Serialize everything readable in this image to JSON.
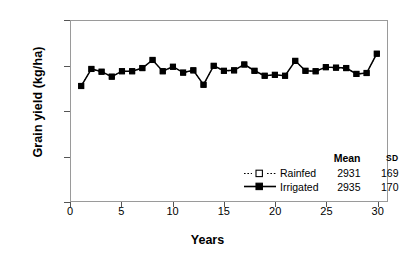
{
  "chart_data": {
    "type": "line",
    "title": "",
    "xlabel": "Years",
    "ylabel": "Grain yield (kg/ha)",
    "xlim": [
      0,
      31
    ],
    "ylim": [
      0,
      4000
    ],
    "grid": false,
    "legend_position": "inside-bottom-right",
    "x_ticks": [
      "0",
      "5",
      "10",
      "15",
      "20",
      "25",
      "30"
    ],
    "x_tick_values": [
      0,
      5,
      10,
      15,
      20,
      25,
      30
    ],
    "y_ticks": [
      "0",
      "1000",
      "2000",
      "3000",
      "4000"
    ],
    "y_tick_values": [
      0,
      1000,
      2000,
      3000,
      4000
    ],
    "x": [
      1,
      2,
      3,
      4,
      5,
      6,
      7,
      8,
      9,
      10,
      11,
      12,
      13,
      14,
      15,
      16,
      17,
      18,
      19,
      20,
      21,
      22,
      23,
      24,
      25,
      26,
      27,
      28,
      29,
      30
    ],
    "series": [
      {
        "name": "Rainfed",
        "marker": "open-square",
        "line": "dotted",
        "mean": 2931,
        "sd": 169,
        "values": [
          2560,
          2930,
          2870,
          2760,
          2880,
          2880,
          2950,
          3130,
          2880,
          2980,
          2850,
          2900,
          2580,
          3000,
          2890,
          2900,
          3030,
          2890,
          2780,
          2800,
          2780,
          3110,
          2890,
          2880,
          2970,
          2960,
          2950,
          2820,
          2840,
          3270
        ]
      },
      {
        "name": "Irrigated",
        "marker": "filled-square",
        "line": "solid",
        "mean": 2935,
        "sd": 170,
        "values": [
          2555,
          2935,
          2875,
          2765,
          2885,
          2885,
          2955,
          3135,
          2885,
          2985,
          2855,
          2905,
          2585,
          3005,
          2895,
          2905,
          3035,
          2895,
          2785,
          2805,
          2785,
          3115,
          2895,
          2885,
          2975,
          2965,
          2955,
          2825,
          2845,
          3275
        ]
      }
    ]
  },
  "legend": {
    "header_mean": "Mean",
    "header_sd": "SD",
    "rows": [
      {
        "name": "Rainfed",
        "mean": "2931",
        "sd": "169"
      },
      {
        "name": "Irrigated",
        "mean": "2935",
        "sd": "170"
      }
    ]
  },
  "axes": {
    "y_title": "Grain yield (kg/ha)",
    "x_title": "Years"
  }
}
